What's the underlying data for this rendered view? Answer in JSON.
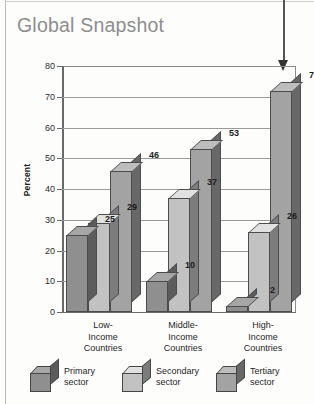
{
  "page": {
    "title": "Global Snapshot"
  },
  "chart_data": {
    "type": "bar",
    "title": "Global Snapshot",
    "xlabel": "",
    "ylabel": "Percent",
    "ylim": [
      0,
      80
    ],
    "ytick_step": 10,
    "yticks": [
      "0",
      "10",
      "20",
      "30",
      "40",
      "50",
      "60",
      "70",
      "80"
    ],
    "grid": true,
    "legend_position": "bottom",
    "categories": [
      "Low-Income Countries",
      "Middle-Income Countries",
      "High-Income Countries"
    ],
    "category_lines": [
      [
        "Low-",
        "Income",
        "Countries"
      ],
      [
        "Middle-",
        "Income",
        "Countries"
      ],
      [
        "High-",
        "Income",
        "Countries"
      ]
    ],
    "series": [
      {
        "name": "Primary sector",
        "label_lines": [
          "Primary",
          "sector"
        ],
        "color": "#8f8f8f",
        "values": [
          25,
          10,
          2
        ]
      },
      {
        "name": "Secondary sector",
        "label_lines": [
          "Secondary",
          "sector"
        ],
        "color": "#c2c2c2",
        "values": [
          29,
          37,
          26
        ]
      },
      {
        "name": "Tertiary sector",
        "label_lines": [
          "Tertiary",
          "sector"
        ],
        "color": "#a3a3a3",
        "values": [
          46,
          53,
          72
        ]
      }
    ],
    "annotations": [
      {
        "name": "pointer-to-high-income-tertiary",
        "target_value": 72,
        "direction": "down"
      }
    ],
    "value_labels": [
      "25",
      "29",
      "46",
      "10",
      "37",
      "53",
      "2",
      "26",
      "72"
    ]
  },
  "colors": {
    "title": "#8d8d8d",
    "axis": "#6a6a6a",
    "gridline": "#9a9a9a",
    "bar_outline": "#4c4c4c",
    "primary_sector": "#8f8f8f",
    "secondary_sector": "#c2c2c2",
    "tertiary_sector": "#a3a3a3",
    "arrow": "#333333"
  }
}
